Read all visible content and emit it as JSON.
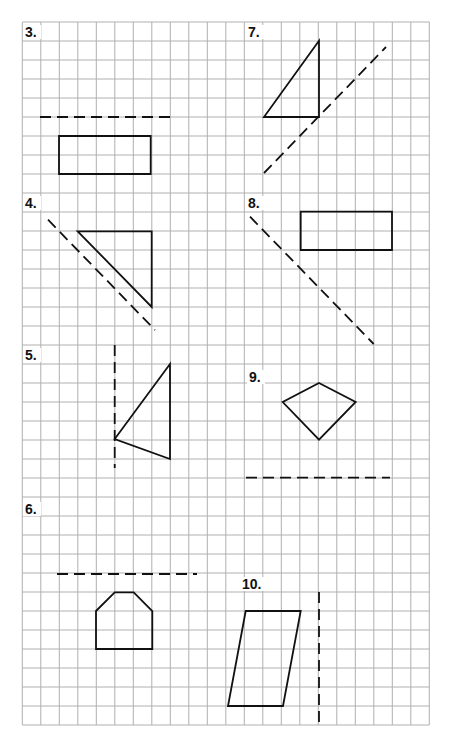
{
  "worksheet": {
    "grid": {
      "x0": 22.3,
      "y0": 22,
      "cols": 22,
      "rows": 37,
      "cell_w": 18.5,
      "cell_h": 19,
      "line_color": "#b0b0b0"
    },
    "shape_color": "#111111",
    "problems": [
      {
        "label": "3.",
        "label_pos": [
          25,
          37
        ],
        "shape": {
          "type": "polygon",
          "points": [
            [
              59,
              136
            ],
            [
              150.7,
              136
            ],
            [
              150.7,
              174
            ],
            [
              59,
              174
            ]
          ]
        },
        "mirror_line": [
          [
            40,
            117
          ],
          [
            170,
            117
          ]
        ]
      },
      {
        "label": "7.",
        "label_pos": [
          248,
          37
        ],
        "shape": {
          "type": "polygon",
          "points": [
            [
              319,
              40.7
            ],
            [
              319,
              117
            ],
            [
              264,
              117
            ]
          ]
        },
        "mirror_line": [
          [
            264,
            173
          ],
          [
            386,
            47
          ]
        ]
      },
      {
        "label": "4.",
        "label_pos": [
          25,
          208
        ],
        "shape": {
          "type": "polygon",
          "points": [
            [
              77.7,
              231.3
            ],
            [
              151.7,
              231.3
            ],
            [
              151.7,
              307
            ]
          ]
        },
        "mirror_line": [
          [
            48,
            219.7
          ],
          [
            155,
            330
          ]
        ]
      },
      {
        "label": "8.",
        "label_pos": [
          248,
          208
        ],
        "shape": {
          "type": "polygon",
          "points": [
            [
              300.7,
              211.7
            ],
            [
              392,
              211.7
            ],
            [
              392,
              250
            ],
            [
              300.7,
              250
            ]
          ]
        },
        "mirror_line": [
          [
            250,
            216.7
          ],
          [
            373.7,
            344
          ]
        ]
      },
      {
        "label": "5.",
        "label_pos": [
          25,
          360
        ],
        "shape": {
          "type": "polygon",
          "points": [
            [
              170,
              364
            ],
            [
              114.7,
              439
            ],
            [
              170,
              459
            ]
          ]
        },
        "mirror_line": [
          [
            114.7,
            345
          ],
          [
            114.7,
            468
          ]
        ]
      },
      {
        "label": "9.",
        "label_pos": [
          249,
          382
        ],
        "shape": {
          "type": "polygon",
          "points": [
            [
              319,
              383
            ],
            [
              355.7,
              402
            ],
            [
              319,
              439.7
            ],
            [
              282.7,
              402
            ]
          ]
        },
        "mirror_line": [
          [
            246,
            477.7
          ],
          [
            390,
            477.7
          ]
        ]
      },
      {
        "label": "6.",
        "label_pos": [
          25,
          514
        ],
        "shape": {
          "type": "polygon",
          "points": [
            [
              96,
              611
            ],
            [
              114.7,
              592.3
            ],
            [
              133.7,
              592.3
            ],
            [
              152.3,
              611
            ],
            [
              152.3,
              649
            ],
            [
              96,
              649
            ]
          ]
        },
        "mirror_line": [
          [
            57,
            574
          ],
          [
            197,
            574
          ]
        ]
      },
      {
        "label": "10.",
        "label_pos": [
          242,
          589
        ],
        "shape": {
          "type": "polygon",
          "points": [
            [
              245.7,
              611
            ],
            [
              300.7,
              611
            ],
            [
              283,
              706
            ],
            [
              228,
              706
            ]
          ]
        },
        "mirror_line": [
          [
            319,
            592
          ],
          [
            319,
            722
          ]
        ]
      }
    ]
  }
}
